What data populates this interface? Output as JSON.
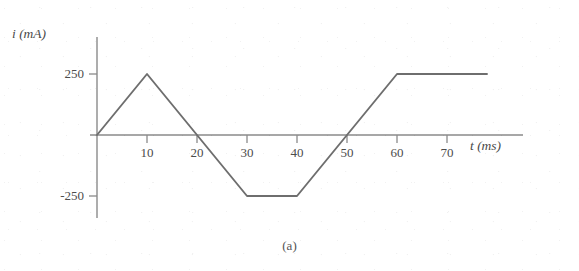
{
  "figure": {
    "caption": "(a)",
    "top_fragment": ""
  },
  "colors": {
    "line": "#6e6e6e",
    "axis": "#8a8a8a",
    "text": "#4c4c4c",
    "background": "#ffffff"
  },
  "chart_data": {
    "type": "line",
    "title": "",
    "subtitle": "",
    "xlabel": "t (ms)",
    "ylabel": "i (mA)",
    "xlim": [
      -2,
      78
    ],
    "ylim": [
      -320,
      330
    ],
    "grid": false,
    "legend": null,
    "xticks": [
      10,
      20,
      30,
      40,
      50,
      60,
      70
    ],
    "xtick_labels": [
      "10",
      "20",
      "30",
      "40",
      "50",
      "60",
      "70"
    ],
    "yticks": [
      250,
      -250
    ],
    "ytick_labels": [
      "250",
      "-250"
    ],
    "series": [
      {
        "name": "i(t)",
        "x": [
          0,
          10,
          20,
          30,
          40,
          50,
          60,
          78
        ],
        "y": [
          0,
          250,
          0,
          -250,
          -250,
          0,
          250,
          250
        ]
      }
    ],
    "annotations": [
      {
        "text": "(a)",
        "role": "figure-caption"
      }
    ]
  }
}
